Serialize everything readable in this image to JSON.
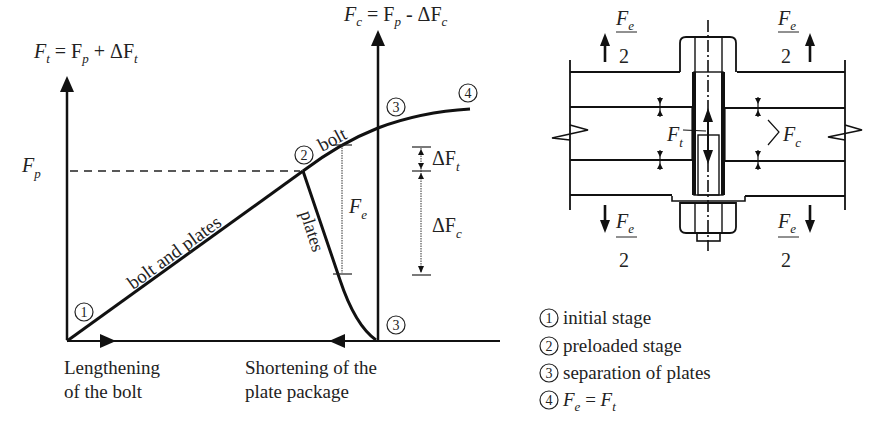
{
  "left_chart": {
    "y_axis_left": {
      "main": "F",
      "sub": "t",
      "rest_a": " = F",
      "sub2": "p",
      "rest_b": " + ΔF",
      "sub3": "t"
    },
    "y_axis_right": {
      "main": "F",
      "sub": "c",
      "rest_a": " = F",
      "sub2": "p",
      "rest_b": " - ΔF",
      "sub3": "c"
    },
    "fp_label": {
      "main": "F",
      "sub": "p"
    },
    "curve_labels": {
      "bolt_and_plates": "bolt and plates",
      "bolt": "bolt",
      "plates": "plates"
    },
    "dims": {
      "fe": {
        "main": "F",
        "sub": "e"
      },
      "dft": {
        "main": "ΔF",
        "sub": "t"
      },
      "dfc": {
        "main": "ΔF",
        "sub": "c"
      }
    },
    "points": {
      "p1": "1",
      "p2": "2",
      "p3a": "3",
      "p3b": "3",
      "p4": "4"
    },
    "x_captions": {
      "left_line1": "Lengthening",
      "left_line2": "of the bolt",
      "right_line1": "Shortening of the",
      "right_line2": "plate package"
    }
  },
  "right_figure": {
    "fe_over_2": {
      "num_main": "F",
      "num_sub": "e",
      "den": "2"
    },
    "ft": {
      "main": "F",
      "sub": "t"
    },
    "fc": {
      "main": "F",
      "sub": "c"
    }
  },
  "legend": [
    {
      "num": "1",
      "text": "initial stage"
    },
    {
      "num": "2",
      "text": "preloaded stage"
    },
    {
      "num": "3",
      "text": "separation of plates"
    },
    {
      "num": "4",
      "eq_main1": "F",
      "eq_sub1": "e",
      "eq_mid": " = ",
      "eq_main2": "F",
      "eq_sub2": "t"
    }
  ]
}
